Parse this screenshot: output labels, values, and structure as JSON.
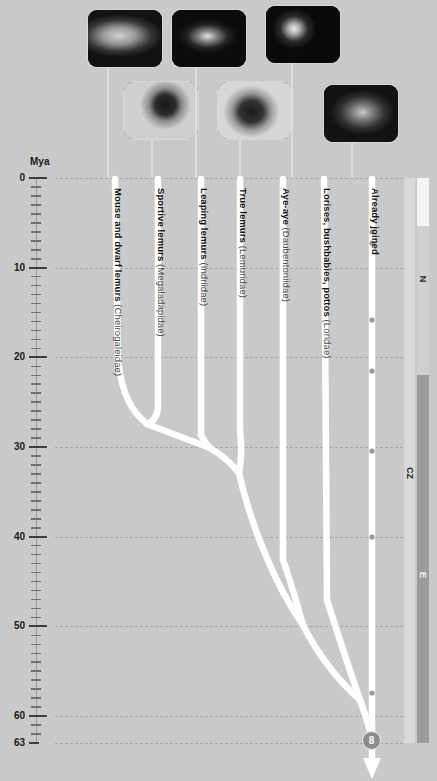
{
  "figure": {
    "type": "phylogenetic-tree",
    "axis": {
      "title": "Mya",
      "unit": "million years ago",
      "direction": "top-to-bottom",
      "range": [
        0,
        63
      ],
      "major_ticks": [
        0,
        10,
        20,
        30,
        40,
        50,
        60,
        63
      ],
      "major_tick_labels": [
        "0",
        "10",
        "20",
        "30",
        "40",
        "50",
        "60",
        "63"
      ],
      "minor_tick_interval": 1,
      "gridlines": "dashed"
    },
    "taxa": [
      {
        "id": "cheirogaleidae",
        "common": "Mouse and dwarf lemurs",
        "family": "(Cheirogaleidae)"
      },
      {
        "id": "megaladapidae",
        "common": "Sportive lemurs",
        "family": "(Megaladapidae)"
      },
      {
        "id": "indriidae",
        "common": "Leaping lemurs",
        "family": "(Indriidae)"
      },
      {
        "id": "lemuridae",
        "common": "True lemurs",
        "family": "(Lemuridae)"
      },
      {
        "id": "daubentoniidae",
        "common": "Aye-aye",
        "family": "(Daubentoniidae)"
      },
      {
        "id": "lorisidae",
        "common": "Lorises, bushbabies, pottos",
        "family": "(Loridae)"
      },
      {
        "id": "outgroup",
        "common": "Already joined",
        "family": ""
      }
    ],
    "nodes": [
      {
        "id": "n1",
        "age_mya": 27.0,
        "children": [
          "cheirogaleidae",
          "megaladapidae"
        ]
      },
      {
        "id": "n2",
        "age_mya": 29.4,
        "children": [
          "n1",
          "indriidae"
        ]
      },
      {
        "id": "n3",
        "age_mya": 32.8,
        "children": [
          "n2",
          "lemuridae"
        ]
      },
      {
        "id": "n4",
        "age_mya": 49.5,
        "children": [
          "n3",
          "daubentoniidae"
        ]
      },
      {
        "id": "n5",
        "age_mya": 58.0,
        "children": [
          "n4",
          "lorisidae"
        ]
      },
      {
        "id": "n6",
        "age_mya": 63.0,
        "label": "8",
        "children": [
          "n5",
          "outgroup"
        ]
      }
    ],
    "root_marker": {
      "label": "8",
      "age_mya": 63
    },
    "geologic_scale": {
      "columns": [
        {
          "name": "era",
          "segments": [
            {
              "label": "CZ",
              "abbrev": "CZ",
              "from_mya": 0,
              "to_mya": 66
            }
          ]
        },
        {
          "name": "period",
          "segments": [
            {
              "label": "N",
              "abbrev": "N",
              "from_mya": 0,
              "to_mya": 23
            },
            {
              "label": "E",
              "abbrev": "E",
              "from_mya": 23,
              "to_mya": 66
            }
          ]
        }
      ]
    },
    "colors": {
      "background": "#c9c9c9",
      "branch": "#ffffff",
      "gridline": "#a8a8a8",
      "text": "#141414",
      "node_badge": "#8d8d8d",
      "geo_light": "#d5d5d5",
      "geo_dark": "#9b9b9b"
    },
    "photos": [
      {
        "id": "photo-cheirogaleidae",
        "alt": "Mouse lemur on branch"
      },
      {
        "id": "photo-megaladapidae",
        "alt": "Sportive lemur clinging to trunk"
      },
      {
        "id": "photo-indriidae",
        "alt": "Leaping lemur (sifaka) in tree"
      },
      {
        "id": "photo-lemuridae",
        "alt": "True lemur perched on trunk"
      },
      {
        "id": "photo-daubentoniidae",
        "alt": "Aye-aye face"
      },
      {
        "id": "photo-lorisidae",
        "alt": "Bushbaby clinging to branch"
      }
    ]
  }
}
